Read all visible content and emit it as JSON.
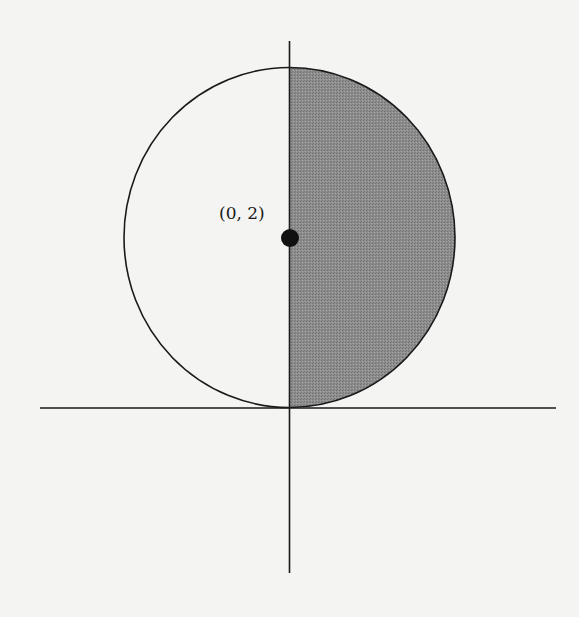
{
  "figure": {
    "type": "circle-with-shaded-half",
    "point_label": "(0, 2)",
    "center": {
      "x": 0,
      "y": 2
    },
    "radius": 2,
    "shaded_region": "right half (x >= 0)",
    "colors": {
      "background": "#f4f4f2",
      "stroke": "#1a1a1a",
      "shade": "#8c8c8c",
      "point": "#111111"
    }
  }
}
